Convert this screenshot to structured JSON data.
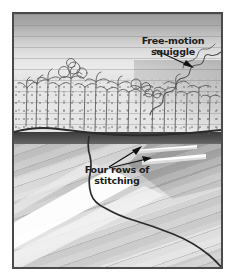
{
  "image": {
    "kind": "quilt-photograph",
    "subject": "landscape art quilt with machine quilting detail",
    "width": 235,
    "height": 277
  },
  "frame": {
    "border_color": "#4a4a4a",
    "background_color": "#ffffff"
  },
  "annotations": [
    {
      "id": "free-motion-squiggle",
      "text": "Free-motion\nsquiggle",
      "line1": "Free-motion",
      "line2": "squiggle",
      "arrow_count": 1,
      "arrow_direction": "down-right",
      "points_to": "squiggly free-motion stitching line on right hillside"
    },
    {
      "id": "four-rows-of-stitching",
      "text": "Four rows of\nstitching",
      "line1": "Four rows of",
      "line2": "stitching",
      "arrow_count": 2,
      "arrow_direction": "up-right",
      "points_to": "two white highlighted stitched rows above the waterline"
    }
  ],
  "regions": {
    "sky": {
      "name": "sky",
      "quilting": "horizontal straight lines",
      "color_top": "#9f9f9f",
      "color_bottom": "#e6e6e6"
    },
    "treeline": {
      "name": "treeline",
      "quilting": "stipple / meander mesh with thread-painted trees",
      "tree_count": 18,
      "color": "#bdbdbd"
    },
    "horizon": {
      "name": "dark shoreline band",
      "color": "#3b3b3b"
    },
    "foreground": {
      "name": "foreground field",
      "quilting": "diagonal straight lines",
      "color": "#d6d6d6",
      "highlight_color": "#ffffff"
    }
  },
  "colors": {
    "label_text": "#1c1c1c",
    "arrow": "#111111",
    "stitch_highlight": "#ffffff",
    "frame_border": "#4a4a4a"
  }
}
